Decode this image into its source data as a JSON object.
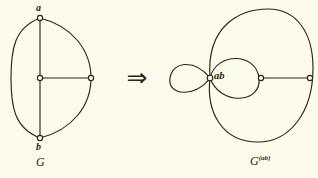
{
  "figure": {
    "background_color": "#fdfcec",
    "ink_color": "#2a2419",
    "arrow_glyph": "⇒",
    "left_graph": {
      "caption": "G",
      "vertex_labels": {
        "top": "a",
        "bottom": "b"
      },
      "vertices": [
        {
          "name": "a",
          "x": 40,
          "y": 18
        },
        {
          "name": "center",
          "x": 40,
          "y": 78
        },
        {
          "name": "right",
          "x": 91,
          "y": 78
        },
        {
          "name": "b",
          "x": 40,
          "y": 138
        }
      ],
      "edges": [
        {
          "name": "arc-left-a-b",
          "type": "curve"
        },
        {
          "name": "arc-right-a-b",
          "type": "curve"
        },
        {
          "name": "edge-a-center",
          "type": "straight"
        },
        {
          "name": "edge-center-b",
          "type": "straight"
        },
        {
          "name": "edge-center-right",
          "type": "straight"
        }
      ]
    },
    "right_graph": {
      "caption_base": "G",
      "caption_superscript": "(ab)",
      "vertex_labels": {
        "merged": "ab"
      },
      "vertices": [
        {
          "name": "ab",
          "x": 210,
          "y": 78
        },
        {
          "name": "middle",
          "x": 261,
          "y": 78
        },
        {
          "name": "right",
          "x": 310,
          "y": 78
        }
      ],
      "edges": [
        {
          "name": "small-loop-left",
          "type": "loop"
        },
        {
          "name": "medium-loop-right",
          "type": "loop"
        },
        {
          "name": "outer-ellipse-ab-right",
          "type": "curve"
        },
        {
          "name": "edge-middle-right",
          "type": "straight"
        }
      ]
    }
  }
}
